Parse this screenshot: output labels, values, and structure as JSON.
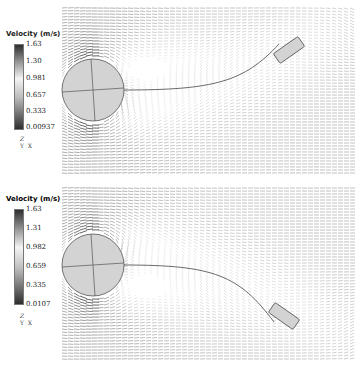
{
  "chart_data": [
    {
      "type": "vector_field",
      "title": "Velocity (m/s)",
      "colormap": "gray diverging (dark-light-dark)",
      "colorbar": {
        "label": "Velocity (m/s)",
        "min": 0.00937,
        "max": 1.63,
        "ticks": [
          "1.63",
          "1.30",
          "0.981",
          "0.657",
          "0.333",
          "0.00937"
        ]
      },
      "axes_indicator": {
        "z": "Z",
        "y": "Y",
        "x": "X"
      },
      "objects": {
        "cylinder": {
          "center": [
            93,
            90
          ],
          "radius": 31,
          "fill": "#d0d0d0"
        },
        "tether_end": [
          145,
          90
        ],
        "tail_body": {
          "center": [
            289,
            50
          ],
          "angle_deg": -35,
          "width": 30,
          "height": 12
        },
        "tether_shape": "curves upward to upper right"
      }
    },
    {
      "type": "vector_field",
      "title": "Velocity (m/s)",
      "colormap": "gray diverging (dark-light-dark)",
      "colorbar": {
        "label": "Velocity (m/s)",
        "min": 0.0107,
        "max": 1.63,
        "ticks": [
          "1.63",
          "1.31",
          "0.982",
          "0.659",
          "0.335",
          "0.0107"
        ]
      },
      "axes_indicator": {
        "z": "Z",
        "y": "Y",
        "x": "X"
      },
      "objects": {
        "cylinder": {
          "center": [
            93,
            265
          ],
          "radius": 31,
          "fill": "#d0d0d0"
        },
        "tether_end": [
          141,
          271
        ],
        "tail_body": {
          "center": [
            284,
            316
          ],
          "angle_deg": 35,
          "width": 30,
          "height": 12
        },
        "tether_shape": "curves downward to lower right"
      }
    }
  ],
  "panels": [
    {
      "legend_title": "Velocity (m/s)",
      "ticks": [
        "1.63",
        "1.30",
        "0.981",
        "0.657",
        "0.333",
        "0.00937"
      ],
      "axis_z": "Z",
      "axis_y": "Y",
      "axis_x": "X"
    },
    {
      "legend_title": "Velocity (m/s)",
      "ticks": [
        "1.63",
        "1.31",
        "0.982",
        "0.659",
        "0.335",
        "0.0107"
      ],
      "axis_z": "Z",
      "axis_y": "Y",
      "axis_x": "X"
    }
  ],
  "colors": {
    "body_fill": "#d3d3d3",
    "body_stroke": "#555555",
    "tether": "#444444",
    "vector_dark": "#333333",
    "vector_light": "#c8c8c8"
  }
}
